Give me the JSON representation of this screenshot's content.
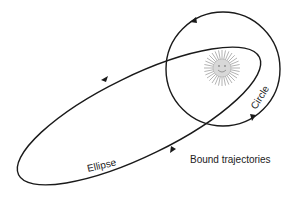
{
  "diagram": {
    "title": "Bound trajectories",
    "labels": {
      "ellipse": "Ellipse",
      "circle": "Circle"
    },
    "central_body": "sun-icon",
    "colors": {
      "stroke": "#1a1a1a",
      "sun": "#9a9a9a",
      "text": "#222222"
    }
  }
}
